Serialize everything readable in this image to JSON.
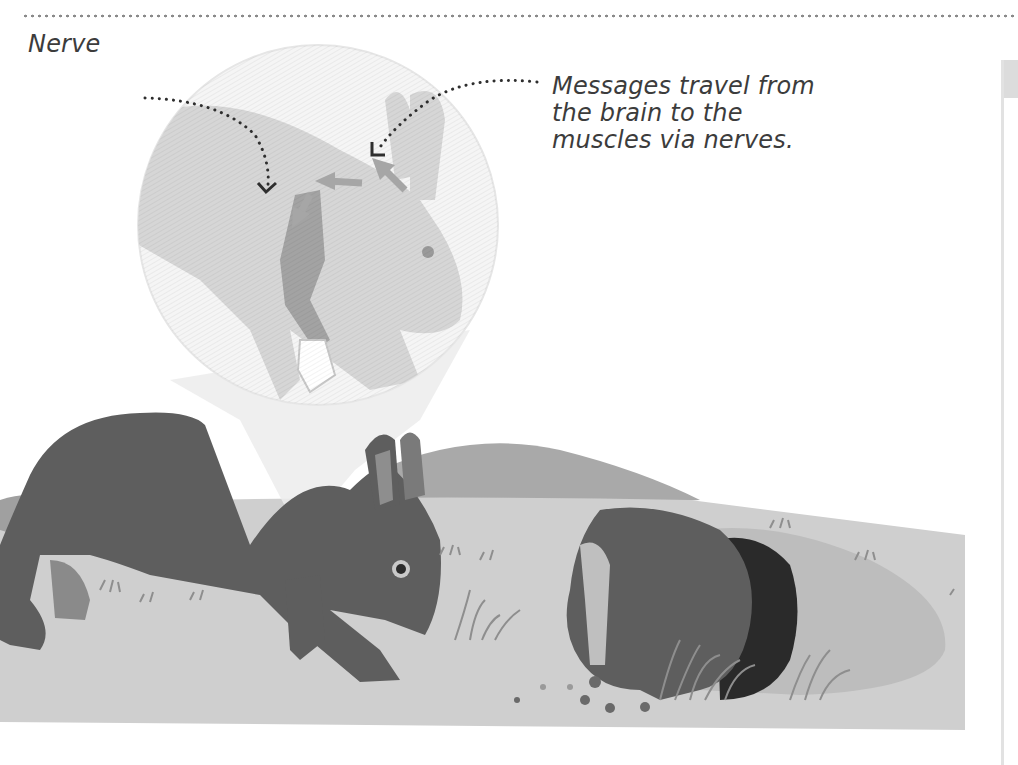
{
  "page": {
    "type": "book-illustration",
    "background": "#ffffff"
  },
  "labels": {
    "nerve": "Nerve",
    "messages_line1": "Messages travel from",
    "messages_line2": "the brain to the",
    "messages_line3": "muscles via nerves."
  },
  "illustration": {
    "subject": "Running rabbit with magnified inset showing nerve pathway",
    "inset": "Magnified rabbit showing brain-to-muscle nerve arrows",
    "main_rabbit": "Dark grey rabbit running left to right",
    "second_rabbit": "Rabbit diving into burrow on right",
    "colors": {
      "rabbit_dark": "#5e5e5e",
      "rabbit_light": "#8e8e8e",
      "ground": "#cfcfcf",
      "hill": "#a9a9a9",
      "inset_fill": "#d8d8d8",
      "inset_circle": "#f3f3f3",
      "muscle": "#a3a3a3",
      "burrow": "#2a2a2a",
      "text": "#3c3c3c"
    }
  }
}
